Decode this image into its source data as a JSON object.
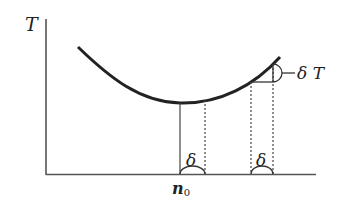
{
  "diagram": {
    "y_axis_label": "T",
    "x_tick_label": "n",
    "x_tick_subscript": "0",
    "delta_left_label": "δ",
    "delta_right_label": "δ",
    "delta_T_label": "δ T",
    "colors": {
      "curve": "#222222",
      "axis": "#555555",
      "guide": "#444444",
      "background": "#ffffff"
    }
  }
}
